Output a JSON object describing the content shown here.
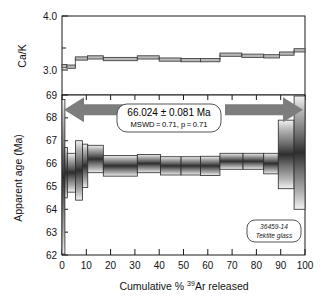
{
  "figure": {
    "sample_label_line1": "36459-14",
    "sample_label_line2": "Tektite glass"
  },
  "callout": {
    "age_text": "66.024 ± 0.081 Ma",
    "stats_text": "MSWD = 0.71, p = 0.71"
  },
  "axes": {
    "cak_title": "Ca/K",
    "age_title": "Apparent age (Ma)",
    "x_title_pre": "Cumulative % ",
    "x_title_sup": "39",
    "x_title_post": "Ar released"
  },
  "chart_data": {
    "type": "area",
    "title": "",
    "xlabel": "Cumulative % 39Ar released",
    "xlim": [
      0,
      100
    ],
    "grid": false,
    "legend": "none",
    "panels": [
      {
        "name": "ca-k-spectrum",
        "ylabel": "Ca/K",
        "ylim": [
          2.55,
          4.0
        ],
        "yticks": [
          3.0,
          3.5,
          4.0
        ],
        "ytick_labels": [
          "3.0",
          "",
          "4.0"
        ],
        "steps": [
          {
            "x0": 0.0,
            "x1": 2.0,
            "value": 3.08,
            "err": 0.03
          },
          {
            "x0": 2.0,
            "x1": 5.5,
            "value": 3.07,
            "err": 0.03
          },
          {
            "x0": 5.5,
            "x1": 10.5,
            "value": 3.22,
            "err": 0.03
          },
          {
            "x0": 10.5,
            "x1": 17.0,
            "value": 3.24,
            "err": 0.03
          },
          {
            "x0": 17.0,
            "x1": 31.0,
            "value": 3.21,
            "err": 0.03
          },
          {
            "x0": 31.0,
            "x1": 40.0,
            "value": 3.24,
            "err": 0.03
          },
          {
            "x0": 40.0,
            "x1": 49.0,
            "value": 3.2,
            "err": 0.03
          },
          {
            "x0": 49.0,
            "x1": 57.0,
            "value": 3.19,
            "err": 0.03
          },
          {
            "x0": 57.0,
            "x1": 65.0,
            "value": 3.19,
            "err": 0.03
          },
          {
            "x0": 65.0,
            "x1": 74.0,
            "value": 3.29,
            "err": 0.03
          },
          {
            "x0": 74.0,
            "x1": 83.0,
            "value": 3.27,
            "err": 0.03
          },
          {
            "x0": 83.0,
            "x1": 89.5,
            "value": 3.26,
            "err": 0.03
          },
          {
            "x0": 89.5,
            "x1": 95.5,
            "value": 3.31,
            "err": 0.03
          },
          {
            "x0": 95.5,
            "x1": 100.0,
            "value": 3.37,
            "err": 0.03
          }
        ]
      },
      {
        "name": "apparent-age-spectrum",
        "ylabel": "Apparent age (Ma)",
        "ylim": [
          62,
          69
        ],
        "yticks": [
          62,
          63,
          64,
          65,
          66,
          67,
          68,
          69
        ],
        "ytick_labels": [
          "62",
          "63",
          "64",
          "65",
          "66",
          "67",
          "68",
          "69"
        ],
        "xticks": [
          0,
          10,
          20,
          30,
          40,
          50,
          60,
          70,
          80,
          90,
          100
        ],
        "xtick_labels": [
          "0",
          "10",
          "20",
          "30",
          "40",
          "50",
          "60",
          "70",
          "80",
          "90",
          "100"
        ],
        "steps": [
          {
            "x0": 0.0,
            "x1": 1.2,
            "age": 65.3,
            "err": 3.5
          },
          {
            "x0": 1.2,
            "x1": 2.2,
            "age": 65.6,
            "err": 1.1
          },
          {
            "x0": 2.2,
            "x1": 5.6,
            "age": 65.6,
            "err": 0.85
          },
          {
            "x0": 5.6,
            "x1": 8.4,
            "age": 65.7,
            "err": 1.3
          },
          {
            "x0": 8.4,
            "x1": 10.6,
            "age": 65.9,
            "err": 0.95
          },
          {
            "x0": 10.6,
            "x1": 17.0,
            "age": 66.2,
            "err": 0.6
          },
          {
            "x0": 17.0,
            "x1": 31.0,
            "age": 65.9,
            "err": 0.45
          },
          {
            "x0": 31.0,
            "x1": 40.5,
            "age": 66.0,
            "err": 0.4
          },
          {
            "x0": 40.5,
            "x1": 49.0,
            "age": 65.9,
            "err": 0.4
          },
          {
            "x0": 49.0,
            "x1": 57.0,
            "age": 65.9,
            "err": 0.4
          },
          {
            "x0": 57.0,
            "x1": 65.0,
            "age": 65.9,
            "err": 0.42
          },
          {
            "x0": 65.0,
            "x1": 74.5,
            "age": 66.1,
            "err": 0.35
          },
          {
            "x0": 74.5,
            "x1": 83.0,
            "age": 66.1,
            "err": 0.35
          },
          {
            "x0": 83.0,
            "x1": 89.0,
            "age": 66.0,
            "err": 0.45
          },
          {
            "x0": 89.0,
            "x1": 95.5,
            "age": 66.4,
            "err": 1.5
          },
          {
            "x0": 95.5,
            "x1": 100.0,
            "age": 66.6,
            "err": 2.6
          }
        ],
        "plateau": {
          "age": 66.024,
          "uncertainty": 0.081,
          "mswd": 0.71,
          "p": 0.71,
          "x0": 0.0,
          "x1": 100.0,
          "marker_y": 68.35
        }
      }
    ]
  }
}
